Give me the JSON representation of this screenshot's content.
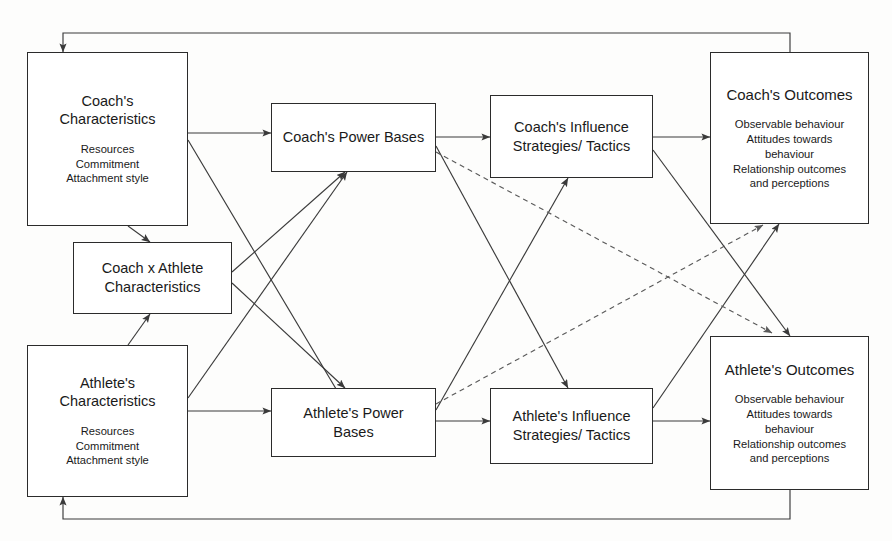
{
  "diagram": {
    "type": "flow-model",
    "background_color": "#fdfdfc",
    "line_color": "#3a3a3a",
    "text_color": "#1a1a1a",
    "nodes": [
      {
        "id": "coach-characteristics",
        "title": "Coach's\nCharacteristics",
        "sub": "Resources\nCommitment\nAttachment style"
      },
      {
        "id": "coach-athlete-characteristics",
        "title": "Coach x Athlete\nCharacteristics",
        "sub": ""
      },
      {
        "id": "athlete-characteristics",
        "title": "Athlete's\nCharacteristics",
        "sub": "Resources\nCommitment\nAttachment style"
      },
      {
        "id": "coach-power-bases",
        "title": "Coach's Power Bases",
        "sub": ""
      },
      {
        "id": "athlete-power-bases",
        "title": "Athlete's Power\nBases",
        "sub": ""
      },
      {
        "id": "coach-influence",
        "title": "Coach's Influence\nStrategies/ Tactics",
        "sub": ""
      },
      {
        "id": "athlete-influence",
        "title": "Athlete's Influence\nStrategies/ Tactics",
        "sub": ""
      },
      {
        "id": "coach-outcomes",
        "title": "Coach's Outcomes",
        "sub": "Observable behaviour\nAttitudes towards\nbehaviour\nRelationship outcomes\nand perceptions"
      },
      {
        "id": "athlete-outcomes",
        "title": "Athlete's Outcomes",
        "sub": "Observable behaviour\nAttitudes towards\nbehaviour\nRelationship outcomes\nand perceptions"
      }
    ],
    "edges": [
      {
        "from": "coach-characteristics",
        "to": "coach-power-bases",
        "style": "solid"
      },
      {
        "from": "coach-characteristics",
        "to": "athlete-power-bases",
        "style": "solid"
      },
      {
        "from": "coach-characteristics",
        "to": "coach-athlete-characteristics",
        "style": "solid"
      },
      {
        "from": "athlete-characteristics",
        "to": "athlete-power-bases",
        "style": "solid"
      },
      {
        "from": "athlete-characteristics",
        "to": "coach-power-bases",
        "style": "solid"
      },
      {
        "from": "athlete-characteristics",
        "to": "coach-athlete-characteristics",
        "style": "solid"
      },
      {
        "from": "coach-athlete-characteristics",
        "to": "coach-power-bases",
        "style": "solid"
      },
      {
        "from": "coach-athlete-characteristics",
        "to": "athlete-power-bases",
        "style": "solid"
      },
      {
        "from": "coach-power-bases",
        "to": "coach-influence",
        "style": "solid"
      },
      {
        "from": "coach-power-bases",
        "to": "athlete-influence",
        "style": "solid"
      },
      {
        "from": "coach-power-bases",
        "to": "athlete-outcomes",
        "style": "dashed"
      },
      {
        "from": "athlete-power-bases",
        "to": "athlete-influence",
        "style": "solid"
      },
      {
        "from": "athlete-power-bases",
        "to": "coach-influence",
        "style": "solid"
      },
      {
        "from": "athlete-power-bases",
        "to": "coach-outcomes",
        "style": "dashed"
      },
      {
        "from": "coach-influence",
        "to": "coach-outcomes",
        "style": "solid"
      },
      {
        "from": "coach-influence",
        "to": "athlete-outcomes",
        "style": "solid"
      },
      {
        "from": "athlete-influence",
        "to": "athlete-outcomes",
        "style": "solid"
      },
      {
        "from": "athlete-influence",
        "to": "coach-outcomes",
        "style": "solid"
      },
      {
        "from": "coach-outcomes",
        "to": "coach-characteristics",
        "style": "solid-feedback-top"
      },
      {
        "from": "athlete-outcomes",
        "to": "athlete-characteristics",
        "style": "solid-feedback-bottom"
      }
    ]
  }
}
